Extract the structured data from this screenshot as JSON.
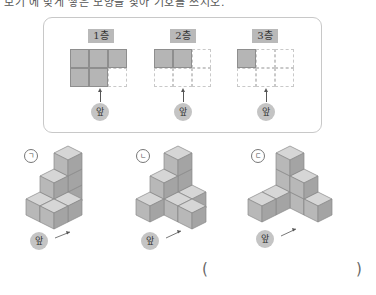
{
  "question": {
    "partial_top_text": "보기 에 맞게 쌓은 모양을 찾아 기호를 쓰시오."
  },
  "plan_views": [
    {
      "label": "1층",
      "grid": [
        [
          1,
          1,
          1
        ],
        [
          1,
          1,
          0
        ]
      ]
    },
    {
      "label": "2층",
      "grid": [
        [
          1,
          1,
          0
        ],
        [
          0,
          0,
          0
        ]
      ]
    },
    {
      "label": "3층",
      "grid": [
        [
          1,
          0,
          0
        ],
        [
          0,
          0,
          0
        ]
      ]
    }
  ],
  "front_label": "앞",
  "options": [
    {
      "marker": "ㄱ"
    },
    {
      "marker": "ㄴ"
    },
    {
      "marker": "ㄷ"
    }
  ],
  "answer": {
    "open_paren": "(",
    "close_paren": ")",
    "value": ""
  },
  "colors": {
    "cube_top": "#d6d6d6",
    "cube_left": "#b8b8b8",
    "cube_right": "#a4a4a4",
    "filled_cell": "#b5b5b5",
    "label_bg": "#b9b9b9"
  }
}
